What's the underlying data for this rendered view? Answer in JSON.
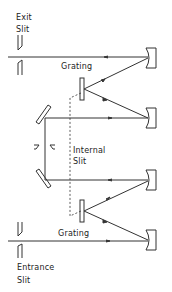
{
  "diagram": {
    "type": "double-monochromator optical layout",
    "labels": {
      "exit_slit_line1": "Exit",
      "exit_slit_line2": "Slit",
      "grating_top": "Grating",
      "internal_slit_line1": "Internal",
      "internal_slit_line2": "Slit",
      "grating_bottom": "Grating",
      "entrance_slit_line1": "Entrance",
      "entrance_slit_line2": "Slit"
    },
    "colors": {
      "line": "#333333",
      "background": "#ffffff"
    },
    "components": [
      {
        "name": "exit-slit"
      },
      {
        "name": "grating-top"
      },
      {
        "name": "concave-mirror-1"
      },
      {
        "name": "concave-mirror-2"
      },
      {
        "name": "plane-mirror-upper"
      },
      {
        "name": "internal-slit"
      },
      {
        "name": "plane-mirror-lower"
      },
      {
        "name": "concave-mirror-3"
      },
      {
        "name": "grating-bottom"
      },
      {
        "name": "concave-mirror-4"
      },
      {
        "name": "entrance-slit"
      }
    ]
  }
}
